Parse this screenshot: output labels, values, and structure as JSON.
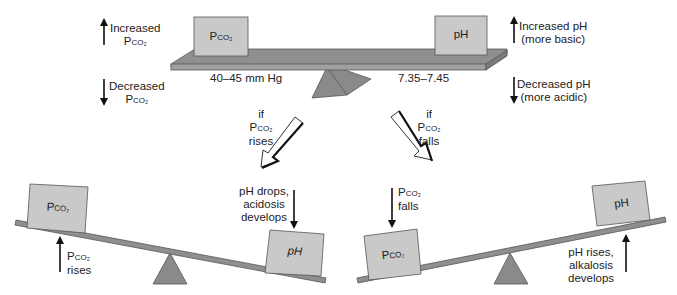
{
  "colors": {
    "box_fill": "#c9c9c9",
    "beam_fill": "#8f8f8f",
    "fulcrum_fill": "#8a8a8a",
    "outline": "#444444",
    "text": "#222222"
  },
  "top": {
    "left_box": {
      "main": "P",
      "sub": "CO₂"
    },
    "right_box": {
      "main": "pH"
    },
    "left_range": "40–45 mm Hg",
    "right_range": "7.35–7.45",
    "left_up": {
      "line1": "Increased",
      "line2_main": "P",
      "line2_sub": "CO₂"
    },
    "left_down": {
      "line1": "Decreased",
      "line2_main": "P",
      "line2_sub": "CO₂"
    },
    "right_up": {
      "line1": "Increased pH",
      "line2": "(more basic)"
    },
    "right_down": {
      "line1": "Decreased pH",
      "line2": "(more acidic)"
    }
  },
  "transitions": {
    "left": {
      "line1": "if",
      "line2_main": "P",
      "line2_sub": "CO₂",
      "line3": "rises"
    },
    "right": {
      "line1": "if",
      "line2_main": "P",
      "line2_sub": "CO₂",
      "line3": "falls"
    }
  },
  "bottom_left": {
    "box_left": {
      "main": "P",
      "sub": "CO₂"
    },
    "box_right": {
      "main": "pH"
    },
    "rise_label": {
      "line1_main": "P",
      "line1_sub": "CO₂",
      "line2": "rises"
    },
    "drop_label": {
      "line1": "pH drops,",
      "line2": "acidosis",
      "line3": "develops"
    }
  },
  "bottom_right": {
    "box_left": {
      "main": "P",
      "sub": "CO₂"
    },
    "box_right": {
      "main": "pH"
    },
    "fall_label": {
      "line1_main": "P",
      "line1_sub": "CO₂",
      "line2": "falls"
    },
    "rise_label": {
      "line1": "pH rises,",
      "line2": "alkalosis",
      "line3": "develops"
    }
  }
}
